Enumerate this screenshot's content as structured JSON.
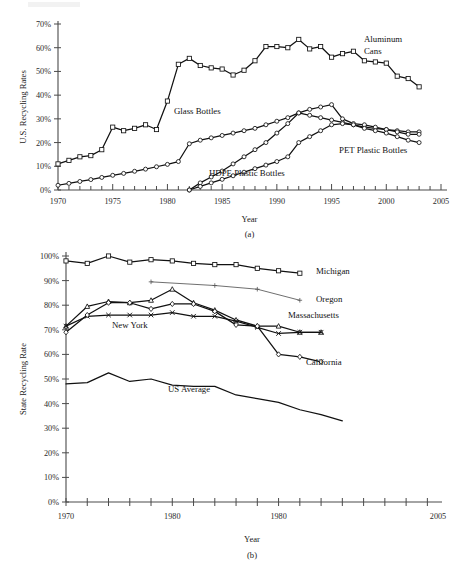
{
  "figure_a": {
    "caption": "(a)",
    "xlabel": "Year",
    "ylabel": "U.S. Recycling Rates",
    "labels": {
      "aluminum_line1": "Aluminum",
      "aluminum_line2": "Cans",
      "glass": "Glass Bottles",
      "pet": "PET Plastic Bottles",
      "hdpe": "HDPE Plastic Bottles"
    }
  },
  "figure_b": {
    "caption": "(b)",
    "xlabel": "Year",
    "ylabel": "State Recycling Rate",
    "labels": {
      "michigan": "Michigan",
      "oregon": "Oregon",
      "massachusetts": "Massachusetts",
      "california": "California",
      "new_york": "New York",
      "us_average": "US Average"
    }
  },
  "chart_data": [
    {
      "id": "figure_a",
      "type": "line",
      "title": "",
      "subtitle": "(a)",
      "xlabel": "Year",
      "ylabel": "U.S. Recycling Rates",
      "xlim": [
        1970,
        2005
      ],
      "ylim": [
        0,
        70
      ],
      "xticks": [
        1970,
        1975,
        1980,
        1985,
        1990,
        1995,
        2000,
        2005
      ],
      "xtick_labels": [
        "1970",
        "1975",
        "1980",
        "1985",
        "1990",
        "1995",
        "2000",
        "2005"
      ],
      "yticks": [
        0,
        10,
        20,
        30,
        40,
        50,
        60,
        70
      ],
      "ytick_labels": [
        "0%",
        "10%",
        "20%",
        "30%",
        "40%",
        "50%",
        "60%",
        "70%"
      ],
      "minor_xticks": 1,
      "grid": false,
      "legend": "inline-annotations",
      "y_unit": "percent",
      "series": [
        {
          "name": "Aluminum Cans",
          "marker": "square",
          "x": [
            1970,
            1971,
            1972,
            1973,
            1974,
            1975,
            1976,
            1977,
            1978,
            1979,
            1980,
            1981,
            1982,
            1983,
            1984,
            1985,
            1986,
            1987,
            1988,
            1989,
            1990,
            1991,
            1992,
            1993,
            1994,
            1995,
            1996,
            1997,
            1998,
            1999,
            2000,
            2001,
            2002,
            2003
          ],
          "values": [
            11.0,
            12.5,
            14.0,
            14.5,
            17.0,
            26.5,
            25.0,
            26.0,
            27.5,
            25.5,
            37.5,
            53.0,
            55.5,
            52.5,
            51.5,
            51.0,
            48.5,
            50.5,
            54.5,
            60.5,
            60.5,
            60.0,
            63.5,
            59.5,
            60.5,
            56.0,
            57.5,
            58.5,
            54.5,
            54.0,
            53.5,
            48.0,
            47.0,
            43.5
          ]
        },
        {
          "name": "Glass Bottles",
          "marker": "circle",
          "x": [
            1970,
            1971,
            1972,
            1973,
            1974,
            1975,
            1976,
            1977,
            1978,
            1979,
            1980,
            1981,
            1982,
            1983,
            1984,
            1985,
            1986,
            1987,
            1988,
            1989,
            1990,
            1991,
            1992,
            1993,
            1994,
            1995,
            1996,
            1997,
            1998,
            1999,
            2000,
            2001,
            2002,
            2003
          ],
          "values": [
            2.0,
            2.8,
            3.6,
            4.4,
            5.3,
            6.2,
            7.0,
            7.9,
            8.8,
            9.8,
            10.8,
            12.0,
            19.5,
            21.0,
            22.0,
            23.0,
            24.0,
            25.0,
            26.0,
            27.5,
            29.0,
            30.5,
            32.5,
            31.5,
            30.5,
            29.5,
            28.5,
            27.5,
            26.5,
            26.0,
            25.5,
            25.0,
            24.5,
            24.5
          ]
        },
        {
          "name": "PET Plastic Bottles",
          "marker": "circle",
          "x": [
            1982,
            1983,
            1984,
            1985,
            1986,
            1987,
            1988,
            1989,
            1990,
            1991,
            1992,
            1993,
            1994,
            1995,
            1996,
            1997,
            1998,
            1999,
            2000,
            2001,
            2002,
            2003
          ],
          "values": [
            0.0,
            3.0,
            5.5,
            8.0,
            11.0,
            14.0,
            17.0,
            20.0,
            24.0,
            28.0,
            32.5,
            34.0,
            35.0,
            36.0,
            30.0,
            28.0,
            27.5,
            26.5,
            25.5,
            24.5,
            23.5,
            23.5
          ]
        },
        {
          "name": "HDPE Plastic Bottles",
          "marker": "circle",
          "x": [
            1982,
            1983,
            1984,
            1985,
            1986,
            1987,
            1988,
            1989,
            1990,
            1991,
            1992,
            1993,
            1994,
            1995,
            1996,
            1997,
            1998,
            1999,
            2000,
            2001,
            2002,
            2003
          ],
          "values": [
            0.0,
            1.5,
            3.0,
            4.5,
            6.0,
            7.5,
            9.0,
            10.5,
            12.0,
            14.0,
            20.0,
            22.5,
            25.0,
            27.5,
            28.0,
            27.5,
            26.0,
            25.0,
            24.0,
            22.5,
            21.0,
            20.0
          ]
        }
      ]
    },
    {
      "id": "figure_b",
      "type": "line",
      "title": "",
      "subtitle": "(b)",
      "xlabel": "Year",
      "ylabel": "State Recycling Rate",
      "xlim": [
        1970,
        2005
      ],
      "ylim": [
        0,
        100
      ],
      "xticks": [
        1970,
        1980,
        1980,
        2005
      ],
      "xtick_labels": [
        "1970",
        "1980",
        "1980",
        "2005"
      ],
      "yticks": [
        0,
        10,
        20,
        30,
        40,
        50,
        60,
        70,
        80,
        90,
        100
      ],
      "ytick_labels": [
        "0%",
        "10%",
        "20%",
        "30%",
        "40%",
        "50%",
        "60%",
        "70%",
        "80%",
        "90%",
        "100%"
      ],
      "minor_xticks": 2,
      "grid": false,
      "legend": "inline-annotations",
      "y_unit": "percent",
      "series": [
        {
          "name": "Michigan",
          "marker": "square",
          "x": [
            1970,
            1972,
            1974,
            1976,
            1978,
            1980,
            1982,
            1984,
            1986,
            1988,
            1990,
            1992
          ],
          "values": [
            98.0,
            97.0,
            100.0,
            97.5,
            98.5,
            98.0,
            97.0,
            96.5,
            96.5,
            95.0,
            94.0,
            93.0
          ]
        },
        {
          "name": "Oregon",
          "marker": "plus",
          "x": [
            1978,
            1984,
            1988,
            1992
          ],
          "values": [
            89.5,
            88.0,
            86.5,
            82.0
          ]
        },
        {
          "name": "Massachusetts",
          "marker": "triangle",
          "x": [
            1970,
            1972,
            1974,
            1976,
            1978,
            1980,
            1982,
            1984,
            1986,
            1988,
            1990,
            1992,
            1994
          ],
          "values": [
            71.5,
            79.5,
            81.5,
            81.0,
            82.0,
            86.5,
            81.0,
            78.0,
            74.0,
            71.5,
            71.5,
            69.0,
            69.0
          ]
        },
        {
          "name": "New York",
          "marker": "x",
          "x": [
            1970,
            1972,
            1974,
            1976,
            1978,
            1980,
            1982,
            1984,
            1986,
            1988,
            1990,
            1992,
            1994
          ],
          "values": [
            71.5,
            75.5,
            76.0,
            76.0,
            76.0,
            77.0,
            75.5,
            75.5,
            73.5,
            71.0,
            68.5,
            69.0,
            69.0
          ]
        },
        {
          "name": "California",
          "marker": "diamond",
          "x": [
            1970,
            1972,
            1974,
            1976,
            1978,
            1980,
            1982,
            1984,
            1986,
            1988,
            1990,
            1992,
            1994
          ],
          "values": [
            69.0,
            76.0,
            81.0,
            81.0,
            78.5,
            80.5,
            80.5,
            77.5,
            72.0,
            71.5,
            60.0,
            59.0,
            57.0
          ]
        },
        {
          "name": "US Average",
          "marker": "none",
          "x": [
            1970,
            1972,
            1974,
            1976,
            1978,
            1980,
            1982,
            1984,
            1986,
            1988,
            1990,
            1992,
            1994,
            1996
          ],
          "values": [
            48.0,
            48.5,
            52.5,
            49.0,
            50.0,
            47.5,
            47.0,
            47.0,
            43.5,
            42.0,
            40.5,
            37.5,
            35.5,
            33.0
          ]
        }
      ]
    }
  ]
}
